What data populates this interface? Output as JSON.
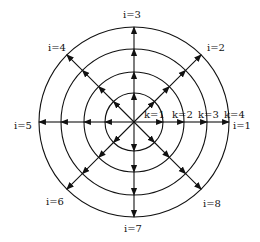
{
  "diagram": {
    "center": [
      134,
      122
    ],
    "radii": [
      29,
      50,
      73,
      95
    ],
    "ring_labels": [
      "k=1",
      "k=2",
      "k=3",
      "k=4"
    ],
    "direction_labels": [
      "i=1",
      "i=2",
      "i=3",
      "i=4",
      "i=5",
      "i=6",
      "i=7",
      "i=8"
    ],
    "stroke_color": "#111111"
  }
}
